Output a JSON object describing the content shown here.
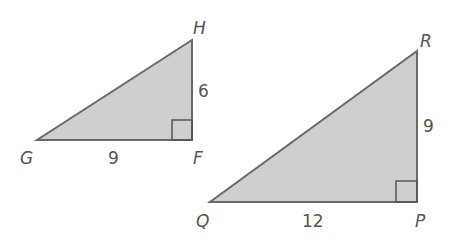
{
  "colors": {
    "fill": "#cfcfcf",
    "stroke": "#6a6a6a",
    "text": "#555555"
  },
  "triangles": [
    {
      "name": "GFH",
      "vertices": {
        "G": "G",
        "F": "F",
        "H": "H"
      },
      "sides": {
        "GF": "9",
        "FH": "6"
      },
      "right_angle_at": "F"
    },
    {
      "name": "QPR",
      "vertices": {
        "Q": "Q",
        "P": "P",
        "R": "R"
      },
      "sides": {
        "QP": "12",
        "PR": "9"
      },
      "right_angle_at": "P"
    }
  ]
}
